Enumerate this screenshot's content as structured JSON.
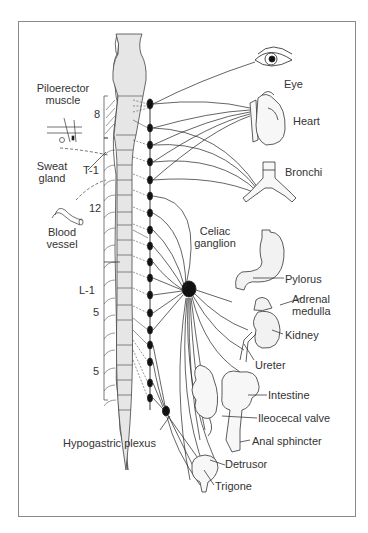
{
  "diagram": {
    "type": "anatomical",
    "segment_labels": {
      "c8": "8",
      "t1": "T-1",
      "t12": "12",
      "l1": "L-1",
      "l5": "5",
      "s5": "5"
    },
    "left_targets": {
      "piloerector_line1": "Piloerector",
      "piloerector_line2": "muscle",
      "sweat_line1": "Sweat",
      "sweat_line2": "gland",
      "blood_line1": "Blood",
      "blood_line2": "vessel"
    },
    "ganglia": {
      "celiac_line1": "Celiac",
      "celiac_line2": "ganglion",
      "hypogastric": "Hypogastric plexus"
    },
    "organs": {
      "eye": "Eye",
      "heart": "Heart",
      "bronchi": "Bronchi",
      "pylorus": "Pylorus",
      "adrenal_line1": "Adrenal",
      "adrenal_line2": "medulla",
      "kidney": "Kidney",
      "ureter": "Ureter",
      "intestine": "Intestine",
      "ileocecal": "Ileocecal valve",
      "anal": "Anal sphincter",
      "detrusor": "Detrusor",
      "trigone": "Trigone"
    },
    "colors": {
      "line": "#222222",
      "cord_fill": "#e6e6e6",
      "frame": "#8a8a8a",
      "text": "#333333"
    }
  }
}
